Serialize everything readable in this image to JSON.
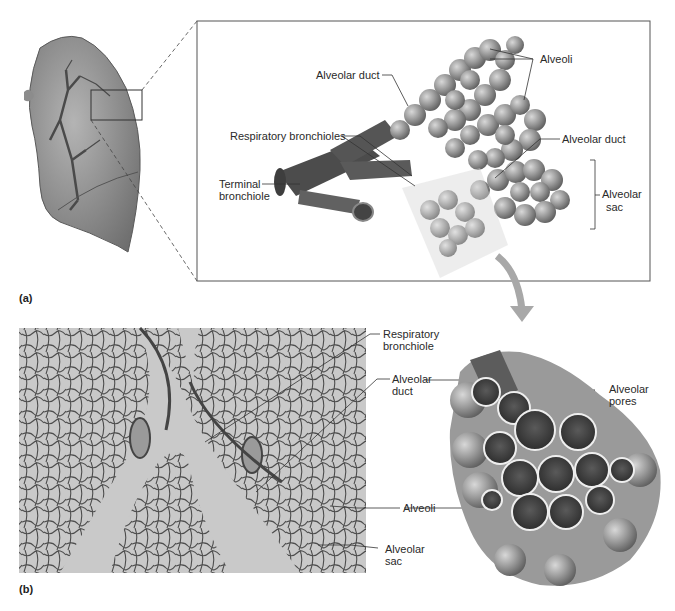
{
  "figure": {
    "panel_a_label": "(a)",
    "panel_b_label": "(b)"
  },
  "panel_a": {
    "labels": {
      "alveoli": "Alveoli",
      "alveolar_duct_upper": "Alveolar duct",
      "respiratory_bronchioles": "Respiratory bronchioles",
      "alveolar_duct_right": "Alveolar duct",
      "terminal_bronchiole_l1": "Terminal",
      "terminal_bronchiole_l2": "bronchiole",
      "alveolar_sac_l1": "Alveolar",
      "alveolar_sac_l2": "sac"
    }
  },
  "panel_b": {
    "labels": {
      "respiratory_bronchiole_l1": "Respiratory",
      "respiratory_bronchiole_l2": "bronchiole",
      "alveolar_duct_l1": "Alveolar",
      "alveolar_duct_l2": "duct",
      "alveoli": "Alveoli",
      "alveolar_sac_l1": "Alveolar",
      "alveolar_sac_l2": "sac",
      "alveolar_pores_l1": "Alveolar",
      "alveolar_pores_l2": "pores"
    }
  },
  "colors": {
    "lung": "#8a8a8a",
    "alveoli": "#9a9a9a",
    "arrow": "#a8a8a8",
    "micrograph_bg": "#c9c9c9",
    "tissue": "#555555"
  }
}
